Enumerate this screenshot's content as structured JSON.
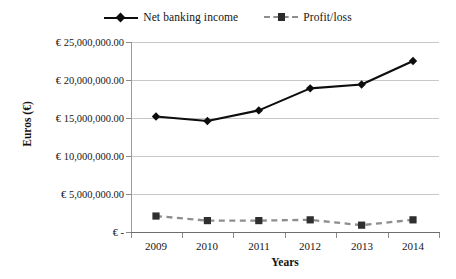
{
  "chart_data": {
    "type": "line",
    "title": "",
    "xlabel": "Years",
    "ylabel": "Euros (€)",
    "categories": [
      "2009",
      "2010",
      "2011",
      "2012",
      "2013",
      "2014"
    ],
    "x": [
      2009,
      2010,
      2011,
      2012,
      2013,
      2014
    ],
    "series": [
      {
        "name": "Net banking income",
        "values": [
          15200000,
          14600000,
          16000000,
          18900000,
          19400000,
          22500000
        ],
        "color": "#0d0d0d",
        "marker": "diamond",
        "line_style": "solid"
      },
      {
        "name": "Profit/loss",
        "values": [
          2100000,
          1500000,
          1500000,
          1600000,
          900000,
          1600000
        ],
        "color": "#8e8e8e",
        "marker": "square",
        "line_style": "dashed"
      }
    ],
    "ylim": [
      0,
      25000000
    ],
    "ytick_values": [
      0,
      5000000,
      10000000,
      15000000,
      20000000,
      25000000
    ],
    "ytick_labels": [
      "€ -",
      "€ 5,000,000.00",
      "€ 10,000,000.00",
      "€ 15,000,000.00",
      "€ 20,000,000.00",
      "€ 25,000,000.00"
    ],
    "grid": "horizontal",
    "legend_position": "top-center"
  },
  "legend": {
    "entries": [
      {
        "label": "Net banking income"
      },
      {
        "label": "Profit/loss"
      }
    ]
  },
  "axes": {
    "x_title": "Years",
    "y_title": "Euros (€)",
    "x_categories": [
      "2009",
      "2010",
      "2011",
      "2012",
      "2013",
      "2014"
    ],
    "y_labels": [
      "€ 25,000,000.00",
      "€ 20,000,000.00",
      "€ 15,000,000.00",
      "€ 10,000,000.00",
      "€ 5,000,000.00",
      "€ -"
    ]
  }
}
